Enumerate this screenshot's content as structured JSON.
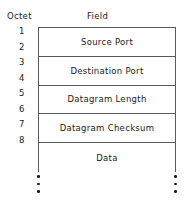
{
  "diagram": {
    "title_visible": false,
    "headers": {
      "octet_label": "Octet",
      "field_label": "Field"
    },
    "octet_numbers": [
      "1",
      "2",
      "3",
      "4",
      "5",
      "6",
      "7",
      "8"
    ],
    "rows": [
      {
        "field": "Source Port",
        "octets": "1-2"
      },
      {
        "field": "Destination Port",
        "octets": "3-4"
      },
      {
        "field": "Datagram Length",
        "octets": "5-6"
      },
      {
        "field": "Datagram Checksum",
        "octets": "7-8"
      },
      {
        "field": "Data",
        "octets": "9+"
      }
    ],
    "continuation": {
      "symbol": "vertical-ellipsis",
      "dot_count": 3,
      "sides": [
        "left",
        "right"
      ]
    },
    "colors": {
      "line": "#5a5a5a",
      "text": "#1a1a1a",
      "background": "#ffffff"
    }
  }
}
